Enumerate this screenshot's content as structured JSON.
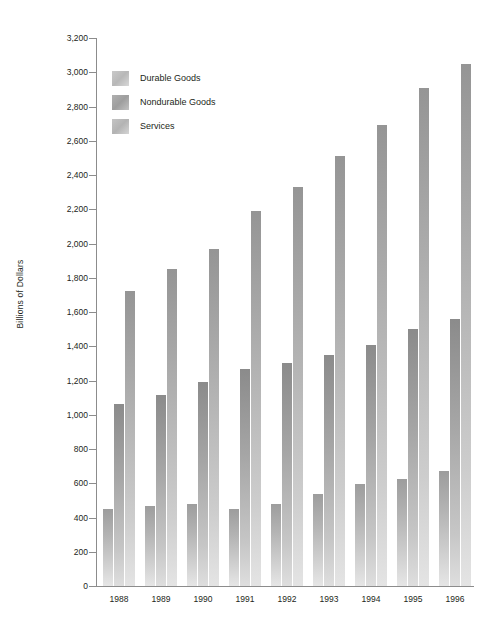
{
  "chart_data": {
    "type": "bar",
    "title": "",
    "subtitle": "",
    "xlabel": "",
    "ylabel": "Billions of Dollars",
    "ylim": [
      0,
      3200
    ],
    "ytick_step": 200,
    "grid": false,
    "legend_position": "upper-left-inside",
    "categories": [
      "1988",
      "1989",
      "1990",
      "1991",
      "1992",
      "1993",
      "1994",
      "1995",
      "1996"
    ],
    "ytick_labels": [
      "0",
      "200",
      "400",
      "600",
      "800",
      "1,000",
      "1,200",
      "1,400",
      "1,600",
      "1,800",
      "2,000",
      "2,200",
      "2,400",
      "2,600",
      "2,800",
      "3,000",
      "3,200"
    ],
    "series": [
      {
        "name": "Durable Goods",
        "color": "#b4b4b4",
        "values": [
          450,
          470,
          480,
          450,
          480,
          535,
          595,
          625,
          670
        ]
      },
      {
        "name": "Nondurable Goods",
        "color": "#9e9e9e",
        "values": [
          1060,
          1115,
          1190,
          1265,
          1305,
          1350,
          1405,
          1500,
          1560
        ]
      },
      {
        "name": "Services",
        "color": "#adadad",
        "values": [
          1720,
          1850,
          1970,
          2190,
          2330,
          2510,
          2690,
          2910,
          3050
        ]
      }
    ]
  },
  "legend": {
    "items": [
      {
        "label": "Durable Goods",
        "key": "durable"
      },
      {
        "label": "Nondurable Goods",
        "key": "nondurable"
      },
      {
        "label": "Services",
        "key": "services"
      }
    ]
  },
  "axis": {
    "y_title": "Billions of Dollars"
  }
}
